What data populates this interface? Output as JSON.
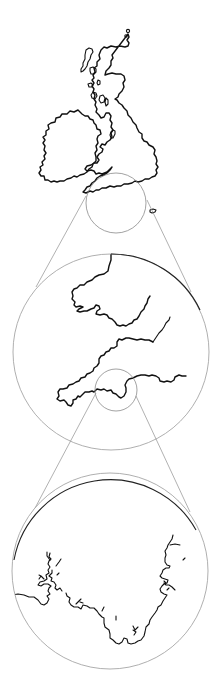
{
  "figure": {
    "levels": [
      {
        "name": "british-isles",
        "region": "Great Britain and Ireland",
        "magnifier": {
          "cx": 116,
          "cy": 203,
          "r": 30
        }
      },
      {
        "name": "southwest-england-wales",
        "region": "Wales, Bristol Channel and South West England",
        "frame": {
          "cx": 111,
          "cy": 352,
          "r": 98
        },
        "magnifier": {
          "cx": 116,
          "cy": 390,
          "r": 21
        }
      },
      {
        "name": "south-devon-cornwall-coast",
        "region": "South Devon / Cornwall coast detail",
        "frame": {
          "cx": 110,
          "cy": 571,
          "r": 98
        }
      }
    ],
    "connectors": [
      {
        "from": [
          86,
          196
        ],
        "to": [
          36,
          287
        ]
      },
      {
        "from": [
          147,
          200
        ],
        "to": [
          191,
          292
        ]
      },
      {
        "from": [
          96,
          393
        ],
        "to": [
          34,
          510
        ]
      },
      {
        "from": [
          136,
          396
        ],
        "to": [
          190,
          512
        ]
      }
    ],
    "colors": {
      "coastline": "#111111",
      "lens": "#8a8a8a",
      "background": "#ffffff"
    }
  }
}
